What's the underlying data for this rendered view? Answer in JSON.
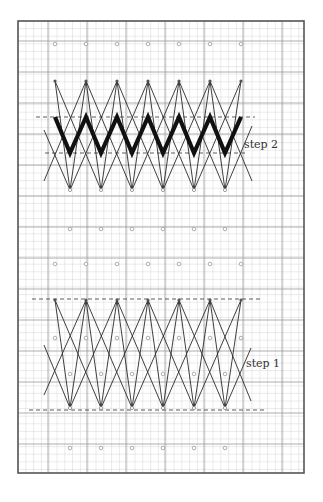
{
  "diagram": {
    "frame": {
      "x": 18,
      "y": 21,
      "width": 286,
      "height": 452
    },
    "grid": {
      "minor_step_x": 7.8,
      "minor_step_y": 7.6,
      "major_x": [
        48,
        87,
        126,
        165,
        204,
        243,
        282
      ],
      "major_y": [
        41,
        72,
        103,
        134,
        165,
        196,
        227,
        258,
        289,
        320,
        351,
        382,
        413,
        444
      ],
      "minor_color": "#d6d6d6",
      "major_color": "#9a9a9a",
      "frame_color": "#555555"
    },
    "colors": {
      "line": "#2a2a2a",
      "thick": "#111111",
      "dot": "#9a9a9a",
      "dash": "#333333"
    },
    "dot_rows": [
      {
        "y": 44,
        "xs": [
          55,
          86,
          117,
          148,
          179,
          210,
          241
        ]
      },
      {
        "y": 229,
        "xs": [
          70,
          101,
          132,
          163,
          194,
          225
        ]
      },
      {
        "y": 264,
        "xs": [
          55,
          86,
          117,
          148,
          179,
          210,
          241
        ]
      },
      {
        "y": 338,
        "xs": [
          55,
          86,
          117,
          148,
          179,
          210,
          241
        ]
      },
      {
        "y": 374,
        "xs": [
          70,
          101,
          132,
          163,
          194,
          225
        ]
      },
      {
        "y": 448,
        "xs": [
          70,
          101,
          132,
          163,
          194,
          225
        ]
      }
    ],
    "steps": [
      {
        "id": "step2",
        "label": "step 2",
        "label_pos": {
          "x": 244,
          "y": 146
        },
        "top_y": 81,
        "bottom_y": 190,
        "top_xs": [
          55,
          86,
          117,
          148,
          179,
          210,
          241
        ],
        "bottom_xs": [
          70,
          101,
          132,
          163,
          194,
          225
        ],
        "dash_top": {
          "y": 117,
          "x1": 36,
          "x2": 255
        },
        "dash_bottom": {
          "y": 153,
          "x1": 45,
          "x2": 245
        },
        "extra_lines": [
          [
            44,
            130,
            70,
            190
          ],
          [
            44,
            181,
            86,
            81
          ],
          [
            225,
            190,
            252,
            126
          ],
          [
            210,
            81,
            252,
            181
          ]
        ],
        "thick_zigzag": {
          "top_y": 117,
          "bottom_y": 153,
          "top_xs": [
            55,
            86,
            117,
            148,
            179,
            210,
            241
          ],
          "bottom_xs": [
            70,
            101,
            132,
            163,
            194,
            225
          ]
        }
      },
      {
        "id": "step1",
        "label": "step 1",
        "label_pos": {
          "x": 246,
          "y": 365
        },
        "top_y": 300,
        "bottom_y": 408,
        "top_xs": [
          55,
          86,
          117,
          148,
          179,
          210,
          241
        ],
        "bottom_xs": [
          70,
          101,
          132,
          163,
          194,
          225
        ],
        "dash_top": {
          "y": 299,
          "x1": 32,
          "x2": 261
        },
        "dash_bottom": {
          "y": 410,
          "x1": 29,
          "x2": 266
        },
        "extra_lines": [
          [
            44,
            345,
            70,
            408
          ],
          [
            44,
            395,
            86,
            300
          ],
          [
            225,
            408,
            251,
            348
          ],
          [
            210,
            300,
            251,
            401
          ]
        ]
      }
    ]
  }
}
